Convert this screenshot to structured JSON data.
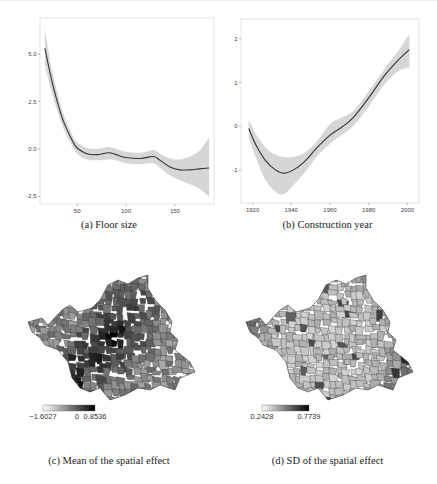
{
  "figure": {
    "panels": [
      {
        "id": "a",
        "caption": "(a)  Floor size"
      },
      {
        "id": "b",
        "caption": "(b)  Construction year"
      },
      {
        "id": "c",
        "caption": "(c)  Mean of the spatial effect"
      },
      {
        "id": "d",
        "caption": "(d)  SD of the spatial effect"
      }
    ]
  },
  "chart_data": [
    {
      "type": "line",
      "title": "(a) Floor size",
      "xlabel": "",
      "ylabel": "",
      "xlim": [
        12,
        190
      ],
      "ylim": [
        -2.9,
        6.9
      ],
      "xticks": [
        50,
        100,
        150
      ],
      "xtick_labels": [
        "50",
        "100",
        "150"
      ],
      "yticks": [
        -2.5,
        0.0,
        2.5,
        5.0
      ],
      "ytick_labels": [
        "-2.5",
        "0.0",
        "2.5",
        "5.0"
      ],
      "grid": false,
      "series": [
        {
          "name": "estimate",
          "x": [
            17,
            25,
            35,
            45,
            50,
            60,
            70,
            82,
            90,
            100,
            115,
            128,
            135,
            145,
            155,
            165,
            175,
            185
          ],
          "values": [
            5.3,
            3.4,
            1.6,
            0.45,
            0.05,
            -0.25,
            -0.3,
            -0.2,
            -0.3,
            -0.45,
            -0.5,
            -0.4,
            -0.6,
            -0.95,
            -1.1,
            -1.1,
            -1.05,
            -1.0
          ]
        },
        {
          "name": "upper_band",
          "x": [
            17,
            25,
            35,
            45,
            50,
            60,
            70,
            82,
            90,
            100,
            115,
            128,
            135,
            145,
            155,
            165,
            175,
            185
          ],
          "values": [
            6.3,
            4.0,
            2.0,
            0.75,
            0.35,
            0.05,
            0.0,
            0.1,
            0.0,
            -0.15,
            -0.2,
            -0.05,
            -0.25,
            -0.5,
            -0.55,
            -0.4,
            -0.1,
            0.6
          ]
        },
        {
          "name": "lower_band",
          "x": [
            17,
            25,
            35,
            45,
            50,
            60,
            70,
            82,
            90,
            100,
            115,
            128,
            135,
            145,
            155,
            165,
            175,
            185
          ],
          "values": [
            4.4,
            2.8,
            1.2,
            0.15,
            -0.25,
            -0.55,
            -0.6,
            -0.55,
            -0.6,
            -0.75,
            -0.8,
            -0.75,
            -1.0,
            -1.4,
            -1.65,
            -1.85,
            -2.1,
            -2.5
          ]
        }
      ]
    },
    {
      "type": "line",
      "title": "(b) Construction year",
      "xlabel": "",
      "ylabel": "",
      "xlim": [
        1914,
        2006
      ],
      "ylim": [
        -1.75,
        2.45
      ],
      "xticks": [
        1920,
        1940,
        1960,
        1980,
        2000
      ],
      "xtick_labels": [
        "1920",
        "1940",
        "1960",
        "1980",
        "2000"
      ],
      "yticks": [
        -1,
        0,
        1,
        2
      ],
      "ytick_labels": [
        "-1",
        "0",
        "1",
        "2"
      ],
      "grid": false,
      "series": [
        {
          "name": "estimate",
          "x": [
            1918,
            1922,
            1927,
            1932,
            1936,
            1941,
            1947,
            1953,
            1960,
            1966,
            1972,
            1980,
            1988,
            1995,
            2001
          ],
          "values": [
            -0.05,
            -0.45,
            -0.8,
            -1.0,
            -1.07,
            -1.0,
            -0.8,
            -0.5,
            -0.2,
            -0.02,
            0.2,
            0.65,
            1.15,
            1.5,
            1.75
          ]
        },
        {
          "name": "upper_band",
          "x": [
            1918,
            1922,
            1927,
            1932,
            1936,
            1941,
            1947,
            1953,
            1960,
            1966,
            1972,
            1980,
            1988,
            1995,
            2001
          ],
          "values": [
            0.15,
            -0.2,
            -0.5,
            -0.65,
            -0.7,
            -0.7,
            -0.6,
            -0.35,
            0.05,
            0.2,
            0.35,
            0.8,
            1.3,
            1.7,
            2.1
          ]
        },
        {
          "name": "lower_band",
          "x": [
            1918,
            1922,
            1927,
            1932,
            1936,
            1941,
            1947,
            1953,
            1960,
            1966,
            1972,
            1980,
            1988,
            1995,
            2001
          ],
          "values": [
            -0.25,
            -0.75,
            -1.25,
            -1.5,
            -1.55,
            -1.35,
            -1.05,
            -0.7,
            -0.4,
            -0.2,
            0.0,
            0.45,
            0.95,
            1.25,
            1.35
          ]
        }
      ]
    },
    {
      "type": "heatmap",
      "title": "(c) Mean of the spatial effect",
      "legend": {
        "min_label": "−1.6027",
        "mid_label": "0",
        "max_label": "0.8536",
        "min": -1.6027,
        "mid": 0,
        "max": 0.8536,
        "palette": [
          "#ffffff",
          "#000000"
        ]
      }
    },
    {
      "type": "heatmap",
      "title": "(d) SD of the spatial effect",
      "legend": {
        "min_label": "0.2428",
        "max_label": "0.7739",
        "min": 0.2428,
        "max": 0.7739,
        "palette": [
          "#ffffff",
          "#000000"
        ]
      }
    }
  ],
  "colors": {
    "line": "#333333",
    "band": "#d6d6d6",
    "frame": "#dddddd",
    "tick_text": "#444444"
  }
}
